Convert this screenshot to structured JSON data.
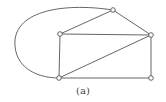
{
  "diagram": {
    "type": "graph",
    "caption": "(a)",
    "nodes": [
      {
        "id": "top",
        "x": 113,
        "y": 10
      },
      {
        "id": "upper-left",
        "x": 60,
        "y": 34
      },
      {
        "id": "right",
        "x": 151,
        "y": 35
      },
      {
        "id": "bottom-left",
        "x": 59,
        "y": 78
      },
      {
        "id": "bottom-right",
        "x": 151,
        "y": 78
      }
    ],
    "edges": [
      {
        "from": "top",
        "to": "upper-left"
      },
      {
        "from": "top",
        "to": "right"
      },
      {
        "from": "upper-left",
        "to": "right"
      },
      {
        "from": "upper-left",
        "to": "bottom-left"
      },
      {
        "from": "right",
        "to": "bottom-left"
      },
      {
        "from": "right",
        "to": "bottom-right"
      },
      {
        "from": "bottom-left",
        "to": "bottom-right"
      },
      {
        "from": "top",
        "to": "bottom-left",
        "curved": true
      }
    ]
  }
}
